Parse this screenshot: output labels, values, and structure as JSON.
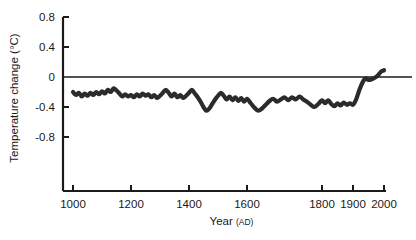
{
  "chart_data": {
    "type": "line",
    "title": "",
    "subtitle": "",
    "xlabel": "Year",
    "xlabel_suffix": "(AD)",
    "ylabel": "Temperature change (°C)",
    "xlim": [
      1000,
      2000
    ],
    "ylim": [
      -0.9,
      0.8
    ],
    "grid": false,
    "legend": "none",
    "x_axis_nonlinear": true,
    "x_ticks": [
      {
        "value": 1000,
        "label": "1000",
        "px": 73
      },
      {
        "value": 1200,
        "label": "1200",
        "px": 131
      },
      {
        "value": 1400,
        "label": "1400",
        "px": 189
      },
      {
        "value": 1600,
        "label": "1600",
        "px": 247
      },
      {
        "value": 1800,
        "label": "1800",
        "px": 322
      },
      {
        "value": 1900,
        "label": "1900",
        "px": 353
      },
      {
        "value": 2000,
        "label": "2000",
        "px": 384
      }
    ],
    "y_ticks": [
      {
        "value": 0.8,
        "label": "0.8"
      },
      {
        "value": 0.4,
        "label": "0.4"
      },
      {
        "value": 0.0,
        "label": "0"
      },
      {
        "value": -0.4,
        "label": "-0.4"
      },
      {
        "value": -0.8,
        "label": "-0.8"
      }
    ],
    "zero_reference_line": {
      "value": 0.0,
      "drawn": true
    },
    "series": [
      {
        "name": "Northern Hemisphere temperature reconstruction",
        "color": "#2b2b2b",
        "x": [
          1000,
          1010,
          1020,
          1030,
          1040,
          1050,
          1060,
          1070,
          1080,
          1090,
          1100,
          1110,
          1120,
          1130,
          1140,
          1150,
          1160,
          1170,
          1180,
          1190,
          1200,
          1210,
          1220,
          1230,
          1240,
          1250,
          1260,
          1270,
          1280,
          1290,
          1300,
          1310,
          1320,
          1330,
          1340,
          1350,
          1360,
          1370,
          1380,
          1390,
          1400,
          1410,
          1420,
          1430,
          1440,
          1450,
          1460,
          1470,
          1480,
          1490,
          1500,
          1510,
          1520,
          1530,
          1540,
          1550,
          1560,
          1570,
          1580,
          1590,
          1600,
          1610,
          1620,
          1630,
          1640,
          1650,
          1660,
          1670,
          1680,
          1690,
          1700,
          1710,
          1720,
          1730,
          1740,
          1750,
          1760,
          1770,
          1780,
          1790,
          1800,
          1810,
          1820,
          1830,
          1840,
          1850,
          1860,
          1870,
          1880,
          1890,
          1900,
          1910,
          1920,
          1930,
          1940,
          1950,
          1960,
          1970,
          1980,
          1990,
          2000
        ],
        "y": [
          -0.2,
          -0.24,
          -0.21,
          -0.26,
          -0.22,
          -0.25,
          -0.21,
          -0.24,
          -0.2,
          -0.23,
          -0.19,
          -0.22,
          -0.17,
          -0.2,
          -0.15,
          -0.18,
          -0.22,
          -0.26,
          -0.23,
          -0.26,
          -0.24,
          -0.27,
          -0.23,
          -0.26,
          -0.22,
          -0.25,
          -0.23,
          -0.27,
          -0.24,
          -0.28,
          -0.25,
          -0.21,
          -0.17,
          -0.21,
          -0.26,
          -0.22,
          -0.27,
          -0.24,
          -0.28,
          -0.25,
          -0.21,
          -0.17,
          -0.22,
          -0.27,
          -0.33,
          -0.4,
          -0.45,
          -0.42,
          -0.36,
          -0.3,
          -0.25,
          -0.21,
          -0.25,
          -0.3,
          -0.26,
          -0.31,
          -0.27,
          -0.32,
          -0.28,
          -0.33,
          -0.29,
          -0.35,
          -0.41,
          -0.45,
          -0.42,
          -0.37,
          -0.32,
          -0.29,
          -0.33,
          -0.3,
          -0.27,
          -0.31,
          -0.27,
          -0.3,
          -0.26,
          -0.3,
          -0.33,
          -0.37,
          -0.4,
          -0.36,
          -0.31,
          -0.35,
          -0.31,
          -0.36,
          -0.39,
          -0.35,
          -0.38,
          -0.34,
          -0.37,
          -0.35,
          -0.37,
          -0.3,
          -0.18,
          -0.08,
          -0.02,
          -0.04,
          -0.03,
          -0.01,
          0.02,
          0.07,
          0.09
        ]
      }
    ],
    "annotations": []
  }
}
